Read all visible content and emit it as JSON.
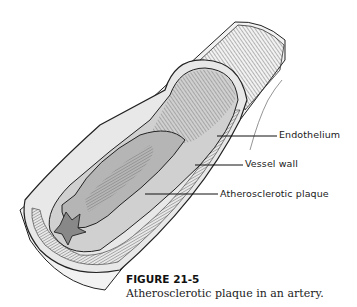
{
  "figure": {
    "number": "FIGURE 21-5",
    "caption": "Atherosclerotic plaque in an artery.",
    "labels": {
      "endothelium": "Endothelium",
      "vessel_wall": "Vessel wall",
      "plaque": "Atherosclerotic plaque"
    }
  }
}
